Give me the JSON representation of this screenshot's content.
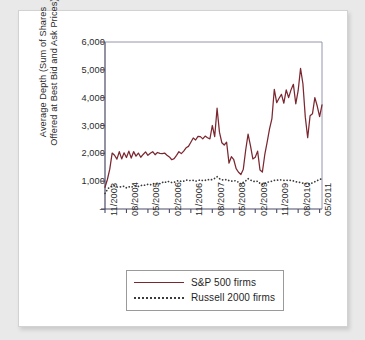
{
  "figure": {
    "background_color": "#ffffff",
    "page_background_color": "#e9e9e9"
  },
  "legend": {
    "position": "below-plot",
    "items": [
      {
        "label": "S&P 500 firms",
        "style": "solid",
        "color": "#7a2730"
      },
      {
        "label": "Russell 2000 firms",
        "style": "dotted",
        "color": "#3b3b3b"
      }
    ]
  },
  "axes": {
    "ylabel_line1": "Average Depth (Sum of Shares",
    "ylabel_line2": "Offered at Best Bid and Ask Prices)",
    "ytick_labels": [
      "6,000",
      "5,000",
      "4,000",
      "3,000",
      "2,000",
      "1,000",
      "–"
    ],
    "ytick_values": [
      6000,
      5000,
      4000,
      3000,
      2000,
      1000,
      0
    ],
    "xtick_labels": [
      "11/2003",
      "08/2004",
      "05/2005",
      "02/2006",
      "11/2006",
      "08/2007",
      "05/2008",
      "02/2009",
      "11/2009",
      "08/2010",
      "05/2011"
    ]
  },
  "chart_data": {
    "type": "line",
    "title": "",
    "xlabel": "",
    "ylabel": "Average Depth (Sum of Shares Offered at Best Bid and Ask Prices)",
    "ylim": [
      0,
      6000
    ],
    "yticks": [
      0,
      1000,
      2000,
      3000,
      4000,
      5000,
      6000
    ],
    "grid": false,
    "legend_position": "below",
    "x_tick_labels": [
      "11/2003",
      "08/2004",
      "05/2005",
      "02/2006",
      "11/2006",
      "08/2007",
      "05/2008",
      "02/2009",
      "11/2009",
      "08/2010",
      "05/2011"
    ],
    "x_tick_indices": [
      0,
      9,
      18,
      27,
      36,
      45,
      54,
      63,
      72,
      81,
      90
    ],
    "x_index_range": [
      0,
      91
    ],
    "series": [
      {
        "name": "S&P 500 firms",
        "style": "solid",
        "color": "#7a2730",
        "values": [
          780,
          1060,
          1430,
          2010,
          1930,
          1790,
          2060,
          1800,
          2020,
          1850,
          2080,
          1830,
          2060,
          1900,
          2010,
          1860,
          1960,
          2050,
          1930,
          2000,
          2060,
          1950,
          2030,
          2000,
          1990,
          2010,
          1930,
          1870,
          1770,
          1810,
          1930,
          2060,
          1990,
          2080,
          2200,
          2250,
          2400,
          2550,
          2480,
          2610,
          2600,
          2520,
          2620,
          2560,
          2520,
          3000,
          2600,
          3620,
          2760,
          2380,
          2300,
          2400,
          1650,
          1880,
          1770,
          1450,
          1320,
          1240,
          1430,
          2120,
          2690,
          2280,
          1800,
          1860,
          2080,
          1400,
          1330,
          1950,
          2400,
          2880,
          3250,
          4300,
          3820,
          3980,
          4120,
          3800,
          4280,
          4000,
          4280,
          4480,
          3780,
          4250,
          5050,
          4500,
          3300,
          2560,
          3350,
          3420,
          4000,
          3700,
          3320,
          3740
        ]
      },
      {
        "name": "Russell 2000 firms",
        "style": "dotted",
        "color": "#3b3b3b",
        "values": [
          560,
          700,
          800,
          810,
          830,
          790,
          790,
          800,
          820,
          760,
          800,
          780,
          820,
          830,
          810,
          840,
          860,
          850,
          890,
          870,
          900,
          920,
          890,
          910,
          960,
          940,
          1000,
          980,
          950,
          960,
          1000,
          1020,
          990,
          1000,
          1040,
          1030,
          1020,
          1030,
          1000,
          1020,
          1050,
          1020,
          1030,
          1060,
          1040,
          1060,
          1100,
          1160,
          1090,
          1050,
          1040,
          1060,
          1020,
          1000,
          1020,
          1010,
          960,
          900,
          960,
          1010,
          1090,
          1040,
          1000,
          980,
          1000,
          920,
          880,
          920,
          960,
          980,
          1000,
          1030,
          1030,
          1050,
          1040,
          1030,
          1040,
          1020,
          1030,
          1010,
          980,
          960,
          950,
          930,
          910,
          890,
          900,
          940,
          980,
          1020,
          1060,
          1090
        ]
      }
    ]
  }
}
